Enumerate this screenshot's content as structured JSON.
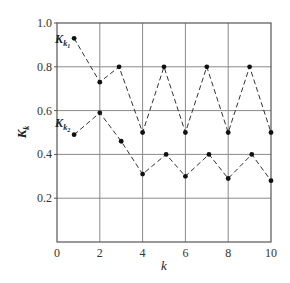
{
  "chart_data": {
    "type": "line",
    "title": "",
    "xlabel": "k",
    "ylabel": {
      "main": "K",
      "sub": "k"
    },
    "xlim": [
      0,
      10
    ],
    "ylim": [
      0,
      1.0
    ],
    "xticks": [
      0,
      2,
      4,
      6,
      8,
      10
    ],
    "xtick_labels": [
      "0",
      "2",
      "4",
      "6",
      "8",
      "10"
    ],
    "yticks": [
      0.2,
      0.4,
      0.6,
      0.8,
      1.0
    ],
    "ytick_labels": [
      "0.2",
      "0.4",
      "0.6",
      "0.8",
      "1.0"
    ],
    "grid": true,
    "legend": "inline labels at series start",
    "line_style": "dashed",
    "marker": "filled-circle",
    "colors": {
      "line": "#333333",
      "grid": "#8a8a8a",
      "axis": "#555555",
      "marker": "#111111"
    },
    "series": [
      {
        "name": "K_k1",
        "label_main": "K",
        "label_sub": "k",
        "label_sub2": "1",
        "x": [
          0.8,
          2,
          2.9,
          4,
          5,
          6,
          7,
          8,
          9,
          10
        ],
        "y": [
          0.93,
          0.73,
          0.8,
          0.5,
          0.8,
          0.5,
          0.8,
          0.5,
          0.8,
          0.5
        ]
      },
      {
        "name": "K_k2",
        "label_main": "K",
        "label_sub": "k",
        "label_sub2": "2",
        "x": [
          0.8,
          2,
          3,
          4,
          5.1,
          6,
          7.1,
          8,
          9.1,
          10
        ],
        "y": [
          0.49,
          0.59,
          0.46,
          0.31,
          0.4,
          0.3,
          0.4,
          0.29,
          0.4,
          0.28
        ]
      }
    ]
  }
}
